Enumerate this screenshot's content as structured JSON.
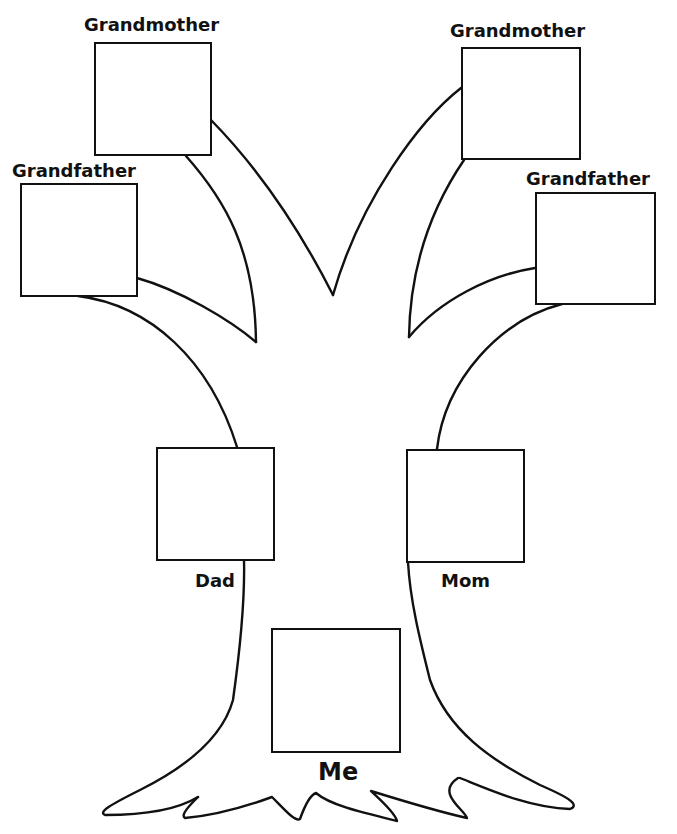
{
  "diagram": {
    "type": "family-tree-worksheet",
    "colors": {
      "stroke": "#111111",
      "background": "#ffffff"
    },
    "members": {
      "paternal_grandmother": {
        "label": "Grandmother"
      },
      "paternal_grandfather": {
        "label": "Grandfather"
      },
      "maternal_grandmother": {
        "label": "Grandmother"
      },
      "maternal_grandfather": {
        "label": "Grandfather"
      },
      "dad": {
        "label": "Dad"
      },
      "mom": {
        "label": "Mom"
      },
      "me": {
        "label": "Me"
      }
    }
  }
}
